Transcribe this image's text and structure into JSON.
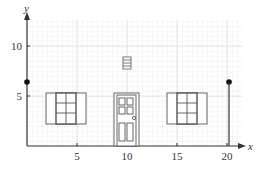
{
  "axes": {
    "x_label": "x",
    "y_label": "y",
    "x_ticks": [
      "5",
      "10",
      "15",
      "20"
    ],
    "y_ticks": [
      "5",
      "10"
    ]
  },
  "points": [
    {
      "x": 0,
      "y": 6
    },
    {
      "x": 20,
      "y": 6
    }
  ],
  "objects": [
    "left-window",
    "door",
    "vent",
    "right-window"
  ]
}
